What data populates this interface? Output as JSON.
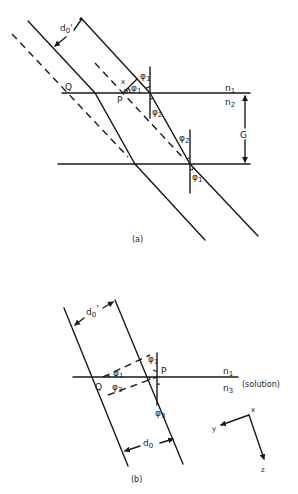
{
  "figure_a": {
    "caption": "(a)",
    "labels": {
      "d0_prime": "d",
      "d0_prime_sub": "0",
      "d0_prime_mark": "'",
      "Q": "Q",
      "P": "P",
      "x": "x",
      "phi1_top": "φ",
      "phi1_top_sub": "1",
      "phi1_inner": "φ",
      "phi1_inner_sub": "1",
      "phi2_upper": "φ",
      "phi2_upper_sub": "2",
      "phi2_lower": "φ",
      "phi2_lower_sub": "2",
      "phi1_bottom": "φ",
      "phi1_bottom_sub": "1",
      "n1": "n",
      "n1_sub": "1",
      "n2": "n",
      "n2_sub": "2",
      "G": "G"
    }
  },
  "figure_b": {
    "caption": "(b)",
    "labels": {
      "d0_prime": "d",
      "d0_prime_sub": "0",
      "d0_prime_mark": "'",
      "d0": "d",
      "d0_sub": "0",
      "Q": "Q",
      "P": "P",
      "phi1_normal": "φ",
      "phi1_normal_sub": "1",
      "phi1_inner": "φ",
      "phi1_inner_sub": "1",
      "phi3_inner": "φ",
      "phi3_inner_sub": "3",
      "phi3_normal": "φ",
      "phi3_normal_sub": "3",
      "n1": "n",
      "n1_sub": "1",
      "n3": "n",
      "n3_sub": "3",
      "solution": "(solution)"
    },
    "axes": {
      "x": "x",
      "y": "y",
      "z": "z"
    }
  },
  "colors": {
    "ink": "#1a1a1a",
    "background": "#ffffff"
  }
}
